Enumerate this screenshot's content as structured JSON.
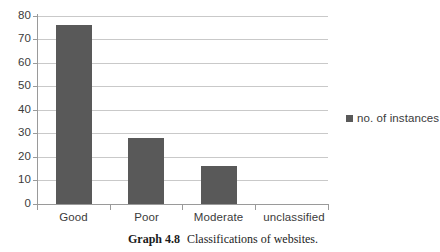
{
  "chart_data": {
    "type": "bar",
    "title": "",
    "xlabel": "",
    "ylabel": "",
    "categories": [
      "Good",
      "Poor",
      "Moderate",
      "unclassified"
    ],
    "values": [
      76,
      28,
      16,
      0
    ],
    "series": [
      {
        "name": "no. of instances",
        "values": [
          76,
          28,
          16,
          0
        ],
        "color": "#595959"
      }
    ],
    "ylim": [
      0,
      80
    ],
    "ytick_labels": [
      "0",
      "10",
      "20",
      "30",
      "40",
      "50",
      "60",
      "70",
      "80"
    ],
    "ytick_values": [
      0,
      10,
      20,
      30,
      40,
      50,
      60,
      70,
      80
    ],
    "grid": "horizontal",
    "legend_position": "right",
    "legend": [
      "no. of instances"
    ]
  },
  "legend": {
    "entries": [
      {
        "label": "no. of instances",
        "color": "#595959"
      }
    ]
  },
  "caption": {
    "label": "Graph 4.8",
    "text": "Classifications of websites."
  },
  "colors": {
    "bar": "#595959",
    "gridline": "#c9c9c9",
    "axis": "#9a9a9a",
    "text": "#3b3b3b",
    "background": "#ffffff"
  }
}
